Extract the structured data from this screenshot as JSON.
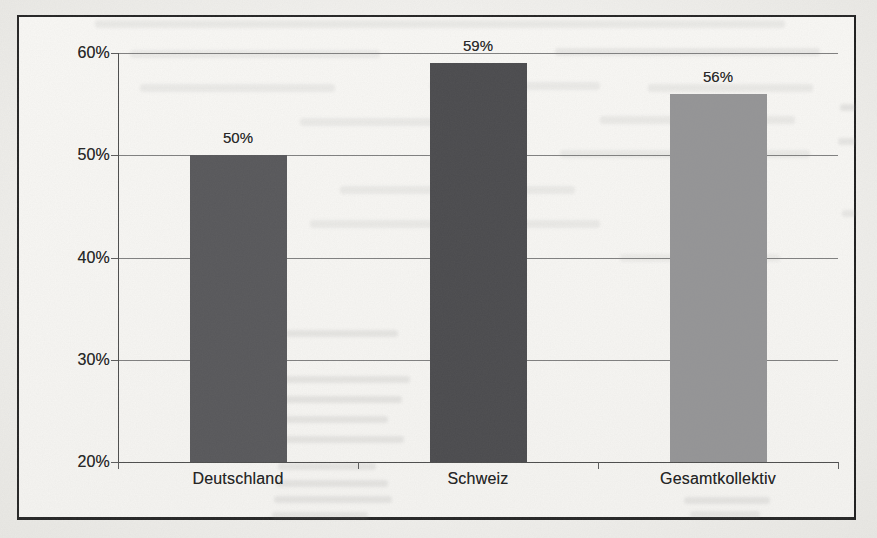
{
  "chart_data": {
    "type": "bar",
    "categories": [
      "Deutschland",
      "Schweiz",
      "Gesamtkollektiv"
    ],
    "values": [
      50,
      59,
      56
    ],
    "value_labels": [
      "50%",
      "59%",
      "56%"
    ],
    "title": "",
    "xlabel": "",
    "ylabel": "",
    "ylim": [
      20,
      60
    ],
    "y_tick_step": 10,
    "y_tick_labels_top_to_bottom": [
      "60%",
      "50%",
      "40%",
      "30%",
      "20%"
    ],
    "grid": "horizontal-on",
    "legend": "none",
    "bar_colors": [
      "#57575a",
      "#4a4a4d",
      "#949496"
    ],
    "plot_background": "#f8f7f4",
    "frame_border_color": "#242424",
    "gridline_color": "#7f7f7f",
    "axis_color": "#4c4c4c",
    "label_color": "#232323"
  }
}
